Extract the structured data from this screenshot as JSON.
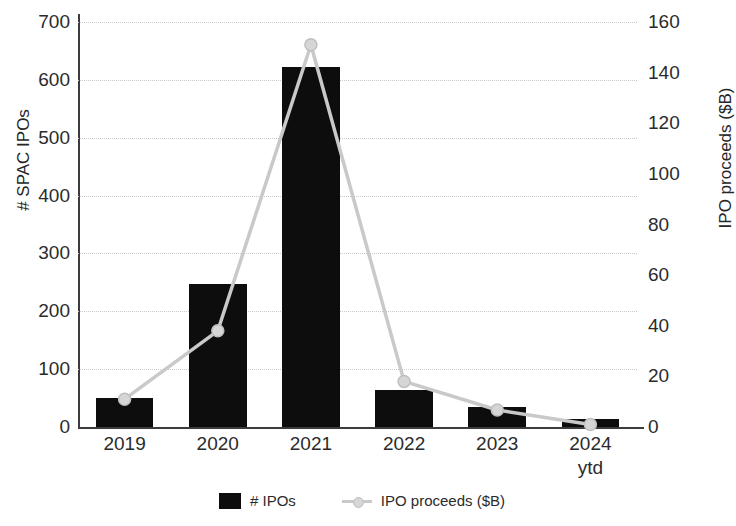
{
  "chart_data": {
    "type": "bar",
    "title": "",
    "categories": [
      "2019",
      "2020",
      "2021",
      "2022",
      "2023",
      "2024 ytd"
    ],
    "category_labels": [
      {
        "line1": "2019",
        "line2": ""
      },
      {
        "line1": "2020",
        "line2": ""
      },
      {
        "line1": "2021",
        "line2": ""
      },
      {
        "line1": "2022",
        "line2": ""
      },
      {
        "line1": "2023",
        "line2": ""
      },
      {
        "line1": "2024",
        "line2": "ytd"
      }
    ],
    "xlabel": "",
    "ylabel": "# SPAC IPOs",
    "y2label": "IPO proceeds ($B)",
    "ylim": [
      0,
      700
    ],
    "y2lim": [
      0,
      160
    ],
    "yticks": [
      0,
      100,
      200,
      300,
      400,
      500,
      600,
      700
    ],
    "y2ticks": [
      0,
      20,
      40,
      60,
      80,
      100,
      120,
      140,
      160
    ],
    "grid": true,
    "legend_position": "bottom",
    "series": [
      {
        "name": "# IPOs",
        "type": "bar",
        "axis": "left",
        "color": "#0d0d0d",
        "values": [
          50,
          248,
          623,
          64,
          35,
          14
        ]
      },
      {
        "name": "IPO proceeds ($B)",
        "type": "line",
        "axis": "right",
        "color": "#c9c9c9",
        "marker_color": "#d6d6d6",
        "values": [
          11,
          38,
          151,
          18,
          6.7,
          1
        ]
      }
    ]
  },
  "legend": {
    "entries": [
      {
        "label": "# IPOs",
        "swatch": "bar-swatch-icon"
      },
      {
        "label": "IPO proceeds ($B)",
        "swatch": "line-marker-icon"
      }
    ]
  }
}
